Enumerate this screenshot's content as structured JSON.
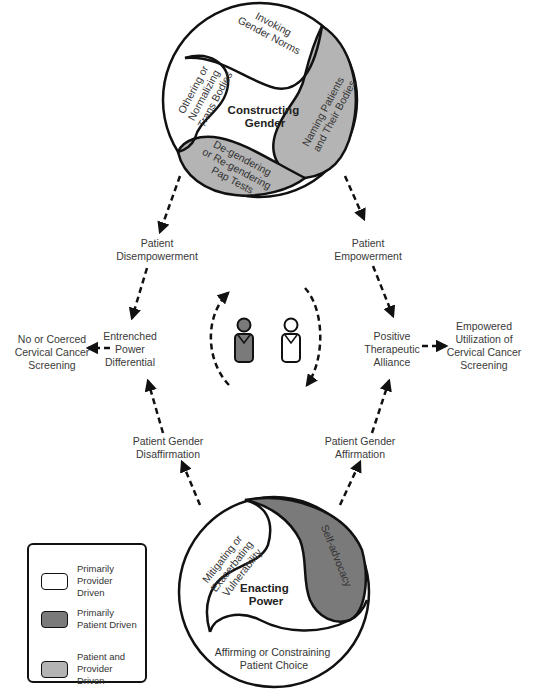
{
  "colors": {
    "provider_driven": "#ffffff",
    "patient_driven": "#7a7a7a",
    "shared": "#b4b4b4",
    "stroke": "#111111",
    "text": "#3a3a3a"
  },
  "top_circle": {
    "title_line1": "Constructing",
    "title_line2": "Gender",
    "segments": [
      {
        "label_lines": [
          "Invoking",
          "Gender Norms"
        ],
        "driver": "provider"
      },
      {
        "label_lines": [
          "Naming Patients",
          "and Their Bodies"
        ],
        "driver": "shared"
      },
      {
        "label_lines": [
          "De-gendering",
          "or Re-gendering",
          "Pap Tests"
        ],
        "driver": "shared"
      },
      {
        "label_lines": [
          "Othering or",
          "Normalizing",
          "Trans Bodies"
        ],
        "driver": "provider"
      }
    ]
  },
  "bottom_circle": {
    "title_line1": "Enacting",
    "title_line2": "Power",
    "segments": [
      {
        "label_lines": [
          "Mitigating or",
          "Exacerbating",
          "Vulnerability"
        ],
        "driver": "provider"
      },
      {
        "label_lines": [
          "Self-advocacy"
        ],
        "driver": "patient"
      },
      {
        "label_lines": [
          "Affirming or Constraining",
          "Patient Choice"
        ],
        "driver": "provider"
      }
    ]
  },
  "nodes": {
    "patient_disempowerment": {
      "line1": "Patient",
      "line2": "Disempowerment"
    },
    "patient_empowerment": {
      "line1": "Patient",
      "line2": "Empowerment"
    },
    "entrenched_power": {
      "line1": "Entrenched",
      "line2": "Power",
      "line3": "Differential"
    },
    "positive_alliance": {
      "line1": "Positive",
      "line2": "Therapeutic",
      "line3": "Alliance"
    },
    "no_coerced_screening": {
      "line1": "No or Coerced",
      "line2": "Cervical Cancer",
      "line3": "Screening"
    },
    "empowered_screening": {
      "line1": "Empowered",
      "line2": "Utilization of",
      "line3": "Cervical Cancer",
      "line4": "Screening"
    },
    "gender_disaffirmation": {
      "line1": "Patient Gender",
      "line2": "Disaffirmation"
    },
    "gender_affirmation": {
      "line1": "Patient Gender",
      "line2": "Affirmation"
    }
  },
  "center_icons": {
    "patient_figure": "person-icon-filled",
    "provider_figure": "person-icon-outline",
    "cycle": "circular-dashed-arrows"
  },
  "legend": {
    "items": [
      {
        "label": "Primarily Provider Driven",
        "color": "#ffffff"
      },
      {
        "label": "Primarily Patient Driven",
        "color": "#7a7a7a"
      },
      {
        "label": "Patient and Provider Driven",
        "color": "#b4b4b4"
      }
    ]
  }
}
